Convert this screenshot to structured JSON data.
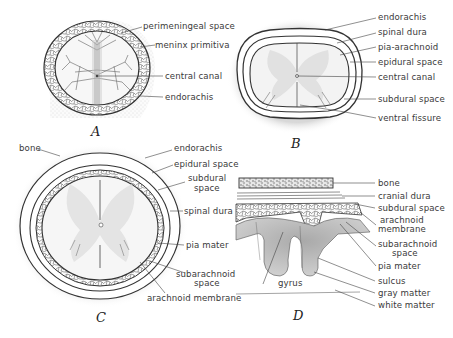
{
  "figure": {
    "panels": [
      {
        "id": "A",
        "letter": "A",
        "labels": [
          {
            "text": "perimeningeal space"
          },
          {
            "text": "meninx primitiva"
          },
          {
            "text": "central canal"
          },
          {
            "text": "endorachis"
          }
        ]
      },
      {
        "id": "B",
        "letter": "B",
        "labels": [
          {
            "text": "endorachis"
          },
          {
            "text": "spinal dura"
          },
          {
            "text": "pia-arachnoid"
          },
          {
            "text": "epidural space"
          },
          {
            "text": "central canal"
          },
          {
            "text": "subdural space"
          },
          {
            "text": "ventral fissure"
          }
        ]
      },
      {
        "id": "C",
        "letter": "C",
        "labels": [
          {
            "text": "bone"
          },
          {
            "text": "endorachis"
          },
          {
            "text": "epidural space"
          },
          {
            "text": "subdural"
          },
          {
            "text": "space"
          },
          {
            "text": "spinal dura"
          },
          {
            "text": "pia mater"
          },
          {
            "text": "subarachnoid"
          },
          {
            "text": "space"
          },
          {
            "text": "arachnoid membrane"
          }
        ]
      },
      {
        "id": "D",
        "letter": "D",
        "labels": [
          {
            "text": "bone"
          },
          {
            "text": "cranial dura"
          },
          {
            "text": "subdural space"
          },
          {
            "text": "arachnoid"
          },
          {
            "text": "membrane"
          },
          {
            "text": "subarachnoid"
          },
          {
            "text": "space"
          },
          {
            "text": "pia mater"
          },
          {
            "text": "sulcus"
          },
          {
            "text": "gray matter"
          },
          {
            "text": "white matter"
          },
          {
            "text": "gyrus"
          }
        ]
      }
    ],
    "colors": {
      "ink": "#2e2e2e",
      "stipple": "#d9d9d9",
      "gray_matter": "#b8b8b8",
      "background": "#ffffff"
    }
  }
}
